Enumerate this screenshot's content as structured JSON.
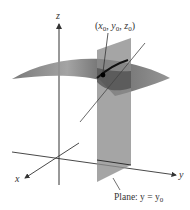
{
  "figure": {
    "axes": {
      "x_label": "x",
      "y_label": "y",
      "z_label": "z"
    },
    "point": {
      "label_open": "(",
      "x": "x",
      "x_sub": "0",
      "y": "y",
      "y_sub": "0",
      "z": "z",
      "z_sub": "0",
      "sep": ", ",
      "label_close": ")"
    },
    "plane": {
      "label_prefix": "Plane: y = y",
      "label_sub": "0"
    },
    "colors": {
      "axis": "#333333",
      "plane": "#8c8c8c",
      "surface_light": "#b5b5b5",
      "surface_dark": "#4a4a4a",
      "curve": "#111111"
    }
  }
}
